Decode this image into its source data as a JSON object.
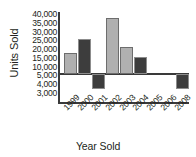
{
  "chart_data": {
    "type": "bar",
    "title": "",
    "xlabel": "Year Sold",
    "ylabel": "Units Sold",
    "categories": [
      "1999",
      "2000",
      "2001",
      "2002",
      "2003",
      "2004",
      "2005",
      "2006",
      "2008"
    ],
    "values": [
      17000,
      25000,
      3400,
      37000,
      20500,
      15000,
      null,
      null,
      3400
    ],
    "series": [
      {
        "name": "Units Sold",
        "values": [
          17000,
          25000,
          3400,
          37000,
          20500,
          15000,
          null,
          null,
          3400
        ]
      }
    ],
    "bar_colors": [
      "#b0b0b0",
      "#3d3d3d",
      "#3d3d3d",
      "#b0b0b0",
      "#b0b0b0",
      "#3d3d3d",
      null,
      null,
      "#3d3d3d"
    ],
    "ytick_labels": [
      "40,000",
      "35,000",
      "30,000",
      "25,000",
      "20,000",
      "15,000",
      "10,000",
      "5,000",
      "4,000",
      "3,000"
    ],
    "ytick_values": [
      40000,
      35000,
      30000,
      25000,
      20000,
      15000,
      10000,
      5000,
      4000,
      3000
    ],
    "baseline_value": 5000,
    "ylim": [
      3000,
      40000
    ],
    "grid": false,
    "legend": "none"
  },
  "axis": {
    "y_title": "Units Sold",
    "x_title": "Year Sold"
  },
  "colors": {
    "bar_light": "#b0b0b0",
    "bar_dark": "#3d3d3d",
    "axis": "#3a3a3a",
    "text": "#231f20",
    "background": "#ffffff"
  }
}
